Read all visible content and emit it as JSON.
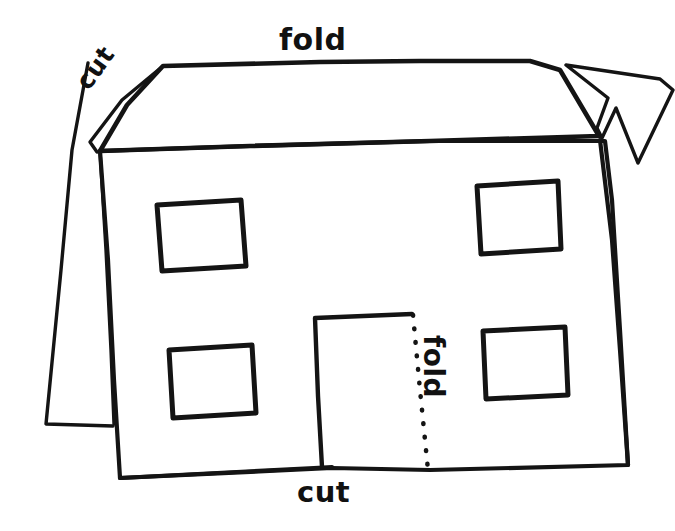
{
  "diagram": {
    "background_color": "#ffffff",
    "ink_color": "#141414",
    "labels": {
      "fold_roof": "fold",
      "cut_left_roof": "cut",
      "fold_door": "fold",
      "cut_bottom": "cut"
    },
    "parts": {
      "roof_label": "roof panel",
      "front_wall_label": "front wall",
      "left_flap_label": "left side flap",
      "right_flap_label": "right side flap",
      "door_label": "door",
      "door_fold_line_label": "door fold dotted line",
      "windows": [
        {
          "name": "window-top-left"
        },
        {
          "name": "window-top-right"
        },
        {
          "name": "window-bottom-left"
        },
        {
          "name": "window-bottom-right"
        }
      ]
    }
  }
}
